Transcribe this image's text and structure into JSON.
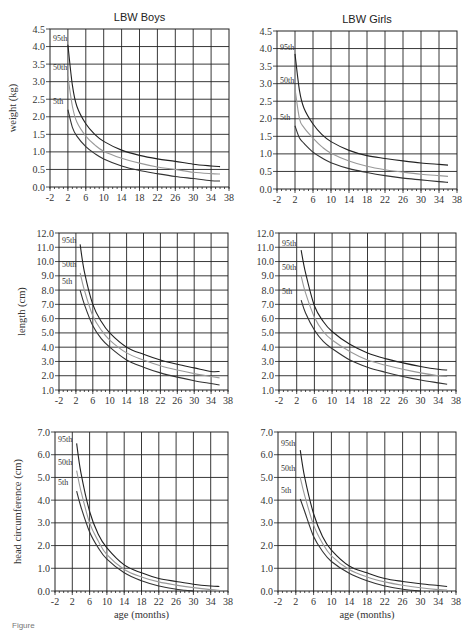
{
  "caption": "Figure",
  "chart_data": [
    {
      "type": "line",
      "title": "LBW Boys",
      "xlabel": "",
      "ylabel": "weight (kg)",
      "xlim": [
        -2,
        38
      ],
      "ylim": [
        0,
        4.5
      ],
      "xticks": [
        "-2",
        "2",
        "6",
        "10",
        "14",
        "18",
        "22",
        "26",
        "30",
        "34",
        "38"
      ],
      "yticks": [
        "0.0",
        "0.5",
        "1.0",
        "1.5",
        "2.0",
        "2.5",
        "3.0",
        "3.5",
        "4.0",
        "4.5"
      ],
      "grid": true,
      "series": [
        {
          "name": "95th",
          "color": "#222222",
          "x": [
            2,
            3,
            4,
            6,
            8,
            10,
            14,
            18,
            22,
            26,
            30,
            34,
            36
          ],
          "y": [
            4.05,
            2.9,
            2.3,
            1.8,
            1.5,
            1.3,
            1.05,
            0.9,
            0.8,
            0.73,
            0.65,
            0.6,
            0.58
          ]
        },
        {
          "name": "50th",
          "color": "#999999",
          "x": [
            2,
            3,
            4,
            6,
            8,
            10,
            14,
            18,
            22,
            26,
            30,
            34,
            36
          ],
          "y": [
            3.15,
            2.3,
            1.85,
            1.45,
            1.2,
            1.02,
            0.82,
            0.68,
            0.57,
            0.5,
            0.42,
            0.38,
            0.37
          ]
        },
        {
          "name": "5th",
          "color": "#333333",
          "x": [
            2,
            3,
            4,
            6,
            8,
            10,
            14,
            18,
            22,
            26,
            30,
            34,
            36
          ],
          "y": [
            2.2,
            1.7,
            1.45,
            1.15,
            0.95,
            0.8,
            0.6,
            0.47,
            0.38,
            0.3,
            0.24,
            0.18,
            0.17
          ]
        }
      ]
    },
    {
      "type": "line",
      "title": "LBW Girls",
      "xlabel": "",
      "ylabel": "",
      "xlim": [
        -2,
        38
      ],
      "ylim": [
        0,
        4.5
      ],
      "xticks": [
        "-2",
        "2",
        "6",
        "10",
        "14",
        "18",
        "22",
        "26",
        "30",
        "34",
        "38"
      ],
      "yticks": [
        "0.0",
        "0.5",
        "1.0",
        "1.5",
        "2.0",
        "2.5",
        "3.0",
        "3.5",
        "4.0",
        "4.5"
      ],
      "grid": true,
      "series": [
        {
          "name": "95th",
          "color": "#222222",
          "x": [
            2,
            3,
            4,
            6,
            8,
            10,
            14,
            18,
            22,
            26,
            30,
            34,
            36
          ],
          "y": [
            3.85,
            2.8,
            2.3,
            1.85,
            1.55,
            1.35,
            1.1,
            0.95,
            0.87,
            0.8,
            0.74,
            0.7,
            0.68
          ]
        },
        {
          "name": "50th",
          "color": "#999999",
          "x": [
            2,
            3,
            4,
            6,
            8,
            10,
            14,
            18,
            22,
            26,
            30,
            34,
            36
          ],
          "y": [
            2.85,
            2.0,
            1.75,
            1.45,
            1.2,
            1.02,
            0.8,
            0.65,
            0.55,
            0.48,
            0.42,
            0.38,
            0.36
          ]
        },
        {
          "name": "5th",
          "color": "#333333",
          "x": [
            2,
            3,
            4,
            6,
            8,
            10,
            14,
            18,
            22,
            26,
            30,
            34,
            36
          ],
          "y": [
            1.8,
            1.45,
            1.3,
            1.05,
            0.88,
            0.75,
            0.58,
            0.47,
            0.38,
            0.31,
            0.26,
            0.21,
            0.19
          ]
        }
      ]
    },
    {
      "type": "line",
      "title": "",
      "xlabel": "",
      "ylabel": "length (cm)",
      "xlim": [
        -2,
        38
      ],
      "ylim": [
        1,
        12
      ],
      "xticks": [
        "-2",
        "2",
        "6",
        "10",
        "14",
        "18",
        "22",
        "26",
        "30",
        "34",
        "38"
      ],
      "yticks": [
        "1.0",
        "2.0",
        "3.0",
        "4.0",
        "5.0",
        "6.0",
        "7.0",
        "8.0",
        "9.0",
        "10.0",
        "11.0",
        "12.0"
      ],
      "grid": true,
      "series": [
        {
          "name": "95th",
          "color": "#222222",
          "x": [
            3,
            4,
            6,
            8,
            10,
            14,
            18,
            22,
            26,
            30,
            34,
            36
          ],
          "y": [
            11.2,
            9.3,
            7.0,
            5.8,
            5.0,
            4.0,
            3.5,
            3.1,
            2.8,
            2.55,
            2.3,
            2.3
          ]
        },
        {
          "name": "50th",
          "color": "#999999",
          "x": [
            3,
            4,
            6,
            8,
            10,
            14,
            18,
            22,
            26,
            30,
            34,
            36
          ],
          "y": [
            9.2,
            8.0,
            6.2,
            5.2,
            4.5,
            3.6,
            3.1,
            2.7,
            2.4,
            2.15,
            1.95,
            1.85
          ]
        },
        {
          "name": "5th",
          "color": "#333333",
          "x": [
            3,
            4,
            6,
            8,
            10,
            14,
            18,
            22,
            26,
            30,
            34,
            36
          ],
          "y": [
            8.0,
            7.0,
            5.5,
            4.6,
            4.0,
            3.1,
            2.6,
            2.2,
            1.9,
            1.65,
            1.45,
            1.35
          ]
        }
      ]
    },
    {
      "type": "line",
      "title": "",
      "xlabel": "",
      "ylabel": "",
      "xlim": [
        -2,
        38
      ],
      "ylim": [
        1,
        12
      ],
      "xticks": [
        "-2",
        "2",
        "6",
        "10",
        "14",
        "18",
        "22",
        "26",
        "30",
        "34",
        "38"
      ],
      "yticks": [
        "1.0",
        "2.0",
        "3.0",
        "4.0",
        "5.0",
        "6.0",
        "7.0",
        "8.0",
        "9.0",
        "10.0",
        "11.0",
        "12.0"
      ],
      "grid": true,
      "series": [
        {
          "name": "95th",
          "color": "#222222",
          "x": [
            3,
            4,
            6,
            8,
            10,
            14,
            18,
            22,
            26,
            30,
            34,
            36
          ],
          "y": [
            10.8,
            9.2,
            6.9,
            5.8,
            5.1,
            4.2,
            3.6,
            3.2,
            2.9,
            2.65,
            2.45,
            2.4
          ]
        },
        {
          "name": "50th",
          "color": "#999999",
          "x": [
            3,
            4,
            6,
            8,
            10,
            14,
            18,
            22,
            26,
            30,
            34,
            36
          ],
          "y": [
            9.0,
            7.8,
            6.1,
            5.1,
            4.5,
            3.7,
            3.1,
            2.75,
            2.45,
            2.2,
            2.0,
            1.95
          ]
        },
        {
          "name": "5th",
          "color": "#333333",
          "x": [
            3,
            4,
            6,
            8,
            10,
            14,
            18,
            22,
            26,
            30,
            34,
            36
          ],
          "y": [
            7.3,
            6.4,
            5.2,
            4.4,
            3.9,
            3.1,
            2.6,
            2.25,
            1.95,
            1.7,
            1.5,
            1.4
          ]
        }
      ]
    },
    {
      "type": "line",
      "title": "",
      "xlabel": "age (months)",
      "ylabel": "head circumference (cm)",
      "xlim": [
        -2,
        38
      ],
      "ylim": [
        0,
        7
      ],
      "xticks": [
        "-2",
        "2",
        "6",
        "10",
        "14",
        "18",
        "22",
        "26",
        "30",
        "34",
        "38"
      ],
      "yticks": [
        "0.0",
        "1.0",
        "2.0",
        "3.0",
        "4.0",
        "5.0",
        "6.0",
        "7.0"
      ],
      "grid": true,
      "series": [
        {
          "name": "95th",
          "color": "#222222",
          "x": [
            3,
            4,
            6,
            8,
            10,
            14,
            18,
            22,
            26,
            30,
            34,
            36
          ],
          "y": [
            6.5,
            5.2,
            3.5,
            2.5,
            1.9,
            1.15,
            0.8,
            0.55,
            0.42,
            0.3,
            0.22,
            0.2
          ]
        },
        {
          "name": "50th",
          "color": "#999999",
          "x": [
            3,
            4,
            6,
            8,
            10,
            14,
            18,
            22,
            26,
            30,
            34,
            36
          ],
          "y": [
            5.3,
            4.4,
            3.0,
            2.2,
            1.6,
            0.95,
            0.62,
            0.4,
            0.26,
            0.15,
            0.06,
            0.03
          ]
        },
        {
          "name": "5th",
          "color": "#333333",
          "x": [
            3,
            4,
            6,
            8,
            10,
            14,
            18,
            22,
            26,
            28,
            30
          ],
          "y": [
            4.4,
            3.7,
            2.6,
            1.9,
            1.4,
            0.8,
            0.45,
            0.22,
            0.08,
            0.03,
            0.0
          ]
        }
      ]
    },
    {
      "type": "line",
      "title": "",
      "xlabel": "age (months)",
      "ylabel": "",
      "xlim": [
        -2,
        38
      ],
      "ylim": [
        0,
        7
      ],
      "xticks": [
        "-2",
        "2",
        "6",
        "10",
        "14",
        "18",
        "22",
        "26",
        "30",
        "34",
        "38"
      ],
      "yticks": [
        "0.0",
        "1.0",
        "2.0",
        "3.0",
        "4.0",
        "5.0",
        "6.0",
        "7.0"
      ],
      "grid": true,
      "series": [
        {
          "name": "95th",
          "color": "#222222",
          "x": [
            3,
            4,
            6,
            8,
            10,
            14,
            18,
            22,
            26,
            30,
            34,
            36
          ],
          "y": [
            6.2,
            5.0,
            3.4,
            2.4,
            1.8,
            1.1,
            0.8,
            0.55,
            0.42,
            0.32,
            0.24,
            0.2
          ]
        },
        {
          "name": "50th",
          "color": "#999999",
          "x": [
            3,
            4,
            6,
            8,
            10,
            14,
            18,
            22,
            26,
            30,
            34,
            36
          ],
          "y": [
            5.0,
            4.2,
            2.9,
            2.1,
            1.55,
            0.95,
            0.62,
            0.4,
            0.25,
            0.14,
            0.06,
            0.04
          ]
        },
        {
          "name": "5th",
          "color": "#333333",
          "x": [
            3,
            4,
            6,
            8,
            10,
            14,
            18,
            22,
            26,
            28,
            30
          ],
          "y": [
            4.05,
            3.5,
            2.4,
            1.75,
            1.3,
            0.78,
            0.45,
            0.22,
            0.08,
            0.03,
            0.0
          ]
        }
      ]
    }
  ]
}
